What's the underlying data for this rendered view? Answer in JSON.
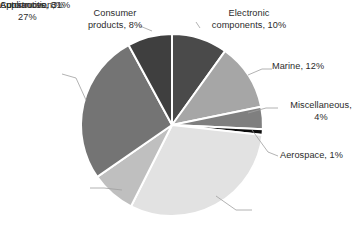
{
  "chart_data": {
    "type": "pie",
    "title": "",
    "start_angle_deg": 0,
    "direction": "clockwise",
    "center": {
      "x": 172,
      "y": 125
    },
    "radius": 91,
    "legend": "none",
    "labels_position": "outside-with-leader-lines",
    "categories": [
      "Electronic components",
      "Marine",
      "Miscellaneous",
      "Aerospace",
      "Automotive",
      "Appliances",
      "Construction",
      "Consumer products"
    ],
    "values": [
      10,
      12,
      4,
      1,
      31,
      8,
      27,
      8
    ],
    "value_suffix": "%",
    "colors": [
      "#4a4a4a",
      "#a6a6a6",
      "#7f7f7f",
      "#0d0d0d",
      "#e2e2e2",
      "#bfbfbf",
      "#747474",
      "#3f3f3f"
    ],
    "slices": [
      {
        "name": "Electronic components",
        "value": 10,
        "color": "#4a4a4a",
        "label": "Electronic\ncomponents, 10%"
      },
      {
        "name": "Marine",
        "value": 12,
        "color": "#a6a6a6",
        "label": "Marine, 12%"
      },
      {
        "name": "Miscellaneous",
        "value": 4,
        "color": "#7f7f7f",
        "label": "Miscellaneous,\n4%"
      },
      {
        "name": "Aerospace",
        "value": 1,
        "color": "#0d0d0d",
        "label": "Aerospace, 1%"
      },
      {
        "name": "Automotive",
        "value": 31,
        "color": "#e2e2e2",
        "label": "Automotive, 31%"
      },
      {
        "name": "Appliances",
        "value": 8,
        "color": "#bfbfbf",
        "label": "Appliances, 8%"
      },
      {
        "name": "Construction",
        "value": 27,
        "color": "#747474",
        "label": "Construction,\n27%"
      },
      {
        "name": "Consumer products",
        "value": 8,
        "color": "#3f3f3f",
        "label": "Consumer\nproducts, 8%"
      }
    ]
  },
  "labels": {
    "consumer_products": "Consumer\nproducts, 8%",
    "electronic_components": "Electronic\ncomponents, 10%",
    "marine": "Marine, 12%",
    "miscellaneous": "Miscellaneous,\n4%",
    "aerospace": "Aerospace, 1%",
    "automotive": "Automotive, 31%",
    "appliances": "Appliances, 8%",
    "construction": "Construction,\n27%"
  },
  "style": {
    "slice_border_color": "#ffffff",
    "leader_line_color": "#a0a0a0",
    "background": "#ffffff",
    "text_color": "#2b2b2b"
  }
}
